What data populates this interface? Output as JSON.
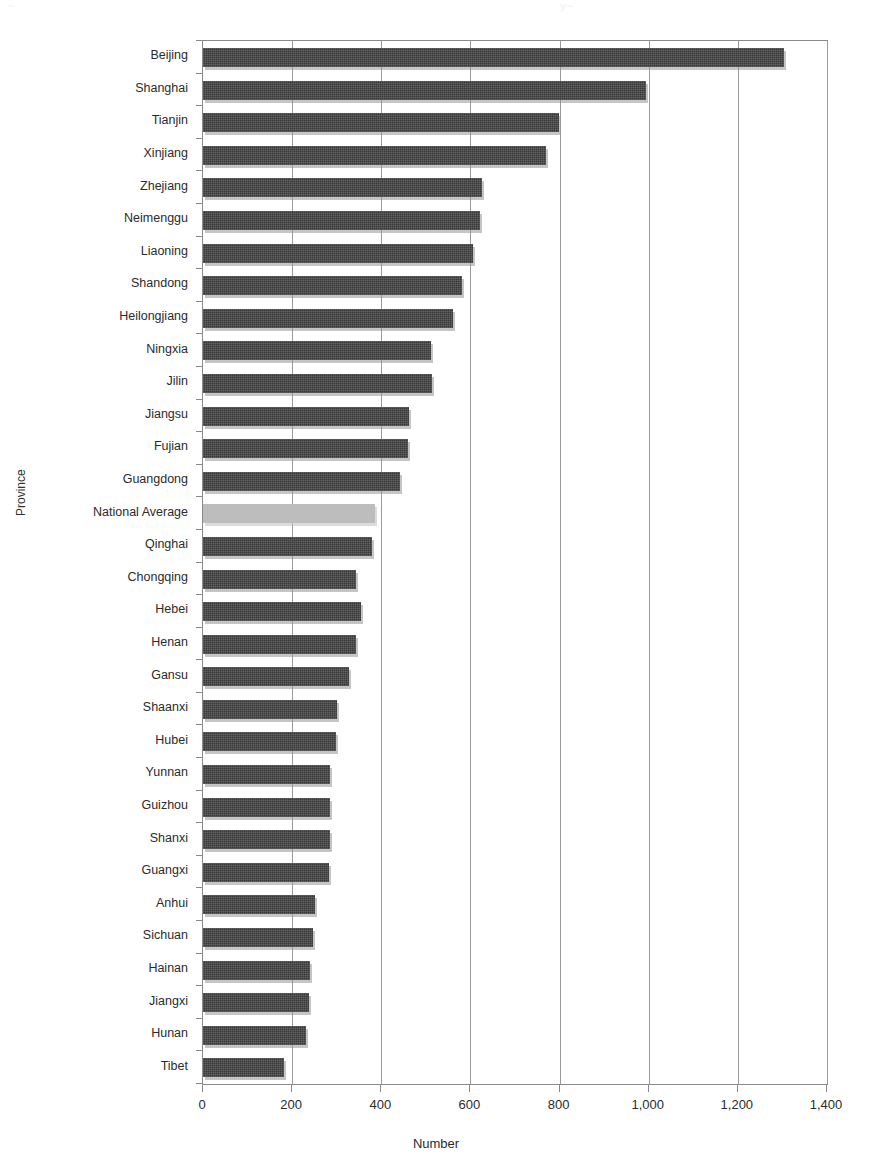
{
  "top_fragment": {
    "left_text": "~",
    "right_text": "y~ "
  },
  "axes": {
    "y_title": "Province",
    "x_title": "Number",
    "x_ticks": [
      "0",
      "200",
      "400",
      "600",
      "800",
      "1,000",
      "1,200",
      "1,400"
    ]
  },
  "colors": {
    "bar": "#3a3a3a",
    "highlight_bar": "#bdbdbd",
    "grid": "#9a9a9a",
    "frame": "#8a8a8a",
    "text": "#2b2b2b"
  },
  "chart_data": {
    "type": "bar",
    "orientation": "horizontal",
    "title": "",
    "xlabel": "Number",
    "ylabel": "Province",
    "xlim": [
      0,
      1400
    ],
    "xticks": [
      0,
      200,
      400,
      600,
      800,
      1000,
      1200,
      1400
    ],
    "grid": "vertical",
    "legend": "none",
    "highlight_category": "National Average",
    "categories": [
      "Beijing",
      "Shanghai",
      "Tianjin",
      "Xinjiang",
      "Zhejiang",
      "Neimenggu",
      "Liaoning",
      "Shandong",
      "Heilongjiang",
      "Ningxia",
      "Jilin",
      "Jiangsu",
      "Fujian",
      "Guangdong",
      "National Average",
      "Qinghai",
      "Chongqing",
      "Hebei",
      "Henan",
      "Gansu",
      "Shaanxi",
      "Hubei",
      "Yunnan",
      "Guizhou",
      "Shanxi",
      "Guangxi",
      "Anhui",
      "Sichuan",
      "Hainan",
      "Jiangxi",
      "Hunan",
      "Tibet"
    ],
    "values": [
      1303,
      994,
      799,
      770,
      626,
      621,
      606,
      581,
      561,
      511,
      514,
      462,
      460,
      442,
      386,
      379,
      343,
      355,
      343,
      328,
      301,
      298,
      285,
      285,
      285,
      283,
      251,
      247,
      240,
      238,
      231,
      182
    ]
  }
}
